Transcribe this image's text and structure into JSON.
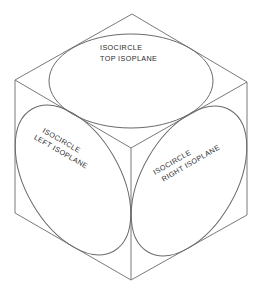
{
  "diagram": {
    "line_color": "#7a7a7a",
    "background": "#ffffff",
    "cube": {
      "vertices": {
        "top": [
          132,
          14
        ],
        "upper_right": [
          247,
          82
        ],
        "lower_right": [
          247,
          215
        ],
        "bottom": [
          131,
          280
        ],
        "lower_left": [
          15,
          213
        ],
        "upper_left": [
          15,
          80
        ],
        "center": [
          131,
          148
        ]
      }
    },
    "isocircles": [
      {
        "id": "top",
        "label_line1": "ISOCIRCLE",
        "label_line2": "TOP ISOPLANE",
        "center": [
          131,
          81
        ],
        "rx": 82,
        "ry": 47,
        "rotation": 0
      },
      {
        "id": "left",
        "label_line1": "ISOCIRCLE",
        "label_line2": "LEFT ISOPLANE",
        "center": [
          73,
          180
        ],
        "rx": 82,
        "ry": 47,
        "rotation": 60
      },
      {
        "id": "right",
        "label_line1": "ISOCIRCLE",
        "label_line2": "RIGHT ISOPLANE",
        "center": [
          189,
          181
        ],
        "rx": 82,
        "ry": 47,
        "rotation": -60
      }
    ]
  }
}
